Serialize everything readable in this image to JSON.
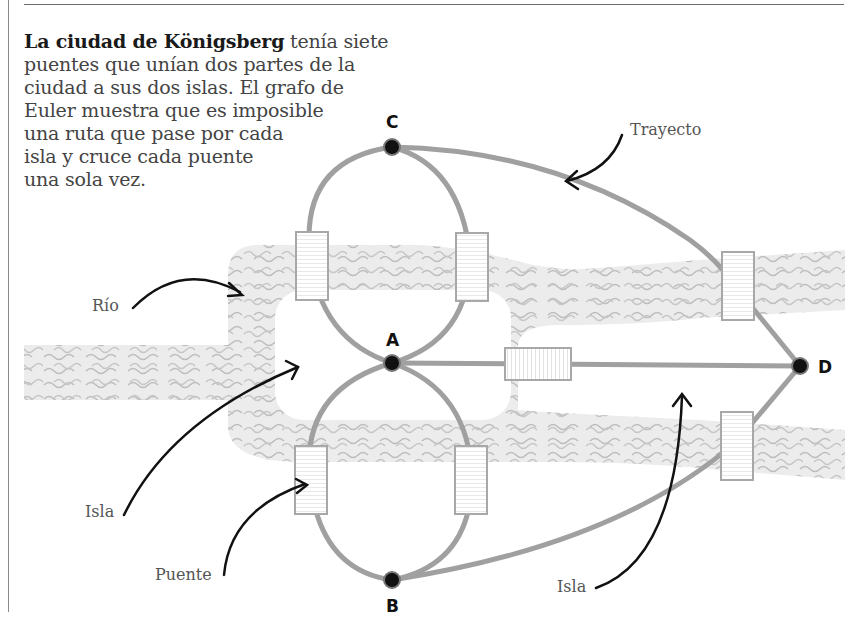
{
  "intro": {
    "bold": "La ciudad de Königsberg",
    "lines": [
      " tenía siete",
      "puentes que unían dos partes de la",
      "ciudad a sus dos islas. El grafo de",
      "Euler muestra que es imposible",
      "una ruta que pase por cada",
      "isla y cruce cada puente",
      "una sola vez."
    ]
  },
  "nodes": {
    "A": {
      "label": "A",
      "x": 392,
      "y": 363
    },
    "B": {
      "label": "B",
      "x": 392,
      "y": 580
    },
    "C": {
      "label": "C",
      "x": 392,
      "y": 147
    },
    "D": {
      "label": "D",
      "x": 800,
      "y": 366
    }
  },
  "labels": {
    "rio": "Río",
    "isla_left": "Isla",
    "puente": "Puente",
    "trayecto": "Trayecto",
    "isla_right": "Isla"
  },
  "colors": {
    "edge": "#a0a0a0",
    "river": "#e6e6e6",
    "wave": "#bdbdbd",
    "bridge_stroke": "#a8a8a8",
    "node": "#111111",
    "arrow": "#111111"
  },
  "bridges_count": 7
}
